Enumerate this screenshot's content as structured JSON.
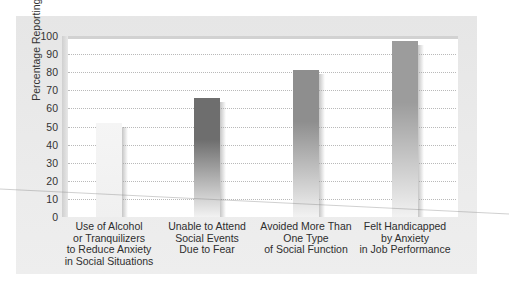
{
  "chart_data": {
    "type": "bar",
    "title": "",
    "xlabel": "",
    "ylabel": "Percentage Reporting Problems",
    "ylim": [
      0,
      100
    ],
    "yticks": [
      0,
      10,
      20,
      30,
      40,
      50,
      60,
      70,
      80,
      90,
      100
    ],
    "grid": true,
    "legend": null,
    "categories": [
      "Use of Alcohol or Tranquilizers to Reduce Anxiety in Social Situations",
      "Unable to Attend Social Events Due to Fear",
      "Avoided More Than One Type of Social Function",
      "Felt Handicapped by Anxiety in Job Performance"
    ],
    "category_lines": [
      [
        "Use of Alcohol",
        "or Tranquilizers",
        "to Reduce Anxiety",
        "in Social Situations"
      ],
      [
        "Unable to Attend",
        "Social Events",
        "Due to Fear"
      ],
      [
        "Avoided More Than",
        "One Type",
        "of Social Function"
      ],
      [
        "Felt Handicapped",
        "by Anxiety",
        "in Job Performance"
      ]
    ],
    "values": [
      52,
      66,
      81,
      97
    ],
    "bar_colors": [
      "#f3f3f3",
      "#6e6e6e",
      "#8e8e8e",
      "#9c9c9c"
    ]
  }
}
